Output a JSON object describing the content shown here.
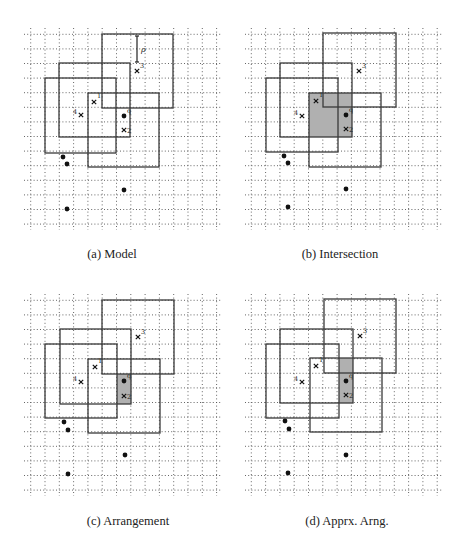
{
  "figure": {
    "colors": {
      "grid": "#555555",
      "square": "#3a3a3a",
      "shade": "#b0b0b0",
      "point": "#111111",
      "background": "#ffffff"
    },
    "panels": [
      {
        "id": "a",
        "caption": "(a) Model",
        "caption_pos": [
          112,
          258
        ],
        "grid": {
          "x0": 30.7,
          "dx": 14.3,
          "nx": 14,
          "y0": 34.3,
          "dy": 14.6,
          "ny": 14,
          "xmin": 24,
          "xmax": 222,
          "ymin": 28,
          "ymax": 230
        },
        "squares": [
          {
            "name": "square-3",
            "x": 102,
            "y": 34,
            "w": 71,
            "h": 74
          },
          {
            "name": "square-upper-left",
            "x": 59,
            "y": 63,
            "w": 71,
            "h": 74
          },
          {
            "name": "square-4",
            "x": 45,
            "y": 78,
            "w": 71,
            "h": 75
          },
          {
            "name": "square-1-2",
            "x": 88,
            "y": 93,
            "w": 71,
            "h": 74
          }
        ],
        "shade": null,
        "points": [
          [
            124,
            116
          ],
          [
            63,
            157
          ],
          [
            67,
            164
          ],
          [
            124,
            190
          ],
          [
            67,
            209
          ]
        ],
        "point_label": {
          "text": "q",
          "x": 127,
          "y": 113
        },
        "crosses": [
          {
            "label": "1",
            "x": 94,
            "y": 102,
            "lx": 97,
            "ly": 98,
            "side": "right"
          },
          {
            "label": "2",
            "x": 124,
            "y": 130,
            "lx": 127,
            "ly": 133,
            "side": "right"
          },
          {
            "label": "3",
            "x": 137,
            "y": 71,
            "lx": 140,
            "ly": 68,
            "side": "right"
          },
          {
            "label": "4",
            "x": 81,
            "y": 115,
            "lx": 73,
            "ly": 114,
            "side": "left"
          }
        ],
        "rho": {
          "label": "ρ",
          "x": 137,
          "y1": 36,
          "y2": 62,
          "lx": 141,
          "ly": 52
        }
      },
      {
        "id": "b",
        "caption": "(b) Intersection",
        "caption_pos": [
          340,
          258
        ],
        "grid": {
          "x0": 251.3,
          "dx": 14.3,
          "nx": 14,
          "y0": 34.3,
          "dy": 14.6,
          "ny": 14,
          "xmin": 245,
          "xmax": 443,
          "ymin": 28,
          "ymax": 230
        },
        "squares": [
          {
            "name": "square-3",
            "x": 323,
            "y": 33,
            "w": 73,
            "h": 74
          },
          {
            "name": "square-upper-left",
            "x": 280,
            "y": 63,
            "w": 72,
            "h": 74
          },
          {
            "name": "square-4",
            "x": 266,
            "y": 78,
            "w": 72,
            "h": 74
          },
          {
            "name": "square-1-2",
            "x": 309,
            "y": 93,
            "w": 72,
            "h": 74
          }
        ],
        "shade": {
          "x": 309,
          "y": 93,
          "w": 43,
          "h": 44
        },
        "points": [
          [
            346,
            115
          ],
          [
            284,
            156
          ],
          [
            288,
            163
          ],
          [
            346,
            189
          ],
          [
            288,
            207
          ]
        ],
        "point_label": {
          "text": "q",
          "x": 349,
          "y": 112
        },
        "crosses": [
          {
            "label": "1",
            "x": 316,
            "y": 101,
            "lx": 319,
            "ly": 97,
            "side": "right"
          },
          {
            "label": "2",
            "x": 346,
            "y": 129,
            "lx": 349,
            "ly": 132,
            "side": "right"
          },
          {
            "label": "3",
            "x": 359,
            "y": 71,
            "lx": 362,
            "ly": 68,
            "side": "right"
          },
          {
            "label": "4",
            "x": 302,
            "y": 116,
            "lx": 294,
            "ly": 115,
            "side": "left"
          }
        ],
        "rho": null
      },
      {
        "id": "c",
        "caption": "(c) Arrangement",
        "caption_pos": [
          128,
          525
        ],
        "grid": {
          "x0": 30.7,
          "dx": 14.3,
          "nx": 14,
          "y0": 300.3,
          "dy": 14.6,
          "ny": 14,
          "xmin": 24,
          "xmax": 222,
          "ymin": 294,
          "ymax": 496
        },
        "squares": [
          {
            "name": "square-3",
            "x": 102,
            "y": 300,
            "w": 72,
            "h": 74
          },
          {
            "name": "square-upper-left",
            "x": 60,
            "y": 329,
            "w": 71,
            "h": 75
          },
          {
            "name": "square-4",
            "x": 45,
            "y": 344,
            "w": 72,
            "h": 74
          },
          {
            "name": "square-1-2",
            "x": 88,
            "y": 359,
            "w": 72,
            "h": 74
          }
        ],
        "shade": {
          "x": 117,
          "y": 374,
          "w": 14,
          "h": 30
        },
        "points": [
          [
            124,
            381
          ],
          [
            64,
            422
          ],
          [
            68,
            430
          ],
          [
            125,
            455
          ],
          [
            68,
            474
          ]
        ],
        "point_label": {
          "text": "q",
          "x": 127,
          "y": 378
        },
        "crosses": [
          {
            "label": "1",
            "x": 95,
            "y": 367,
            "lx": 98,
            "ly": 363,
            "side": "right"
          },
          {
            "label": "2",
            "x": 124,
            "y": 396,
            "lx": 127,
            "ly": 399,
            "side": "right"
          },
          {
            "label": "3",
            "x": 138,
            "y": 337,
            "lx": 141,
            "ly": 334,
            "side": "right"
          },
          {
            "label": "4",
            "x": 81,
            "y": 382,
            "lx": 73,
            "ly": 381,
            "side": "left"
          }
        ],
        "rho": null
      },
      {
        "id": "d",
        "caption": "(d) Apprx. Arng.",
        "caption_pos": [
          347,
          525
        ],
        "grid": {
          "x0": 251.3,
          "dx": 14.3,
          "nx": 14,
          "y0": 300.3,
          "dy": 14.6,
          "ny": 14,
          "xmin": 245,
          "xmax": 443,
          "ymin": 294,
          "ymax": 496
        },
        "squares": [
          {
            "name": "square-3",
            "x": 324,
            "y": 299,
            "w": 72,
            "h": 74
          },
          {
            "name": "square-upper-left",
            "x": 280,
            "y": 329,
            "w": 73,
            "h": 74
          },
          {
            "name": "square-4",
            "x": 266,
            "y": 344,
            "w": 73,
            "h": 74
          },
          {
            "name": "square-1-2",
            "x": 310,
            "y": 358,
            "w": 72,
            "h": 74
          }
        ],
        "shade": {
          "x": 339,
          "y": 358,
          "w": 14,
          "h": 45
        },
        "points": [
          [
            346,
            381
          ],
          [
            285,
            421
          ],
          [
            289,
            429
          ],
          [
            346,
            455
          ],
          [
            288,
            473
          ]
        ],
        "point_label": {
          "text": "q",
          "x": 349,
          "y": 378
        },
        "crosses": [
          {
            "label": "1",
            "x": 316,
            "y": 366,
            "lx": 319,
            "ly": 362,
            "side": "right"
          },
          {
            "label": "2",
            "x": 346,
            "y": 395,
            "lx": 349,
            "ly": 398,
            "side": "right"
          },
          {
            "label": "3",
            "x": 360,
            "y": 336,
            "lx": 363,
            "ly": 333,
            "side": "right"
          },
          {
            "label": "4",
            "x": 302,
            "y": 382,
            "lx": 294,
            "ly": 381,
            "side": "left"
          }
        ],
        "rho": null
      }
    ]
  }
}
